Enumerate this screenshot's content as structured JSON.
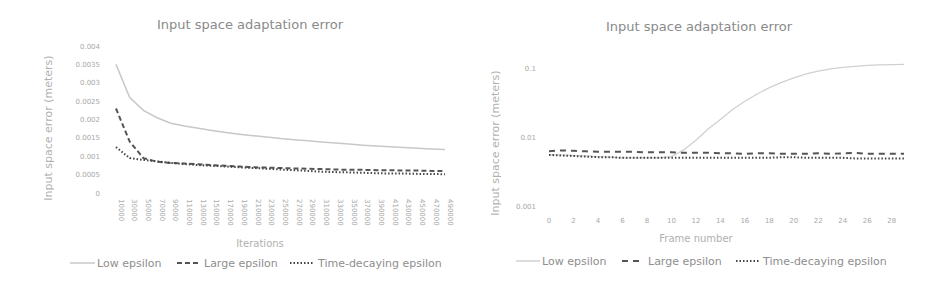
{
  "chart_data": [
    {
      "type": "line",
      "title": "Input space adaptation error",
      "xlabel": "Iterations",
      "ylabel": "Input space error (meters)",
      "y_scale": "linear",
      "ylim": [
        0,
        0.004
      ],
      "y_ticks": [
        "0",
        "0.0005",
        "0.001",
        "0.0015",
        "0.002",
        "0.0025",
        "0.003",
        "0.0035",
        "0.004"
      ],
      "x_ticks": [
        "10000",
        "30000",
        "50000",
        "70000",
        "90000",
        "110000",
        "130000",
        "150000",
        "170000",
        "190000",
        "210000",
        "230000",
        "250000",
        "270000",
        "290000",
        "310000",
        "330000",
        "350000",
        "370000",
        "390000",
        "410000",
        "430000",
        "450000",
        "470000",
        "490000"
      ],
      "legend_position": "bottom",
      "grid": false,
      "series": [
        {
          "name": "Low epsilon",
          "style": "solid",
          "color": "#c8c8c8",
          "values": [
            0.0035,
            0.0026,
            0.00225,
            0.00205,
            0.0019,
            0.00182,
            0.00176,
            0.0017,
            0.00165,
            0.0016,
            0.00156,
            0.00152,
            0.00148,
            0.00145,
            0.00142,
            0.00139,
            0.00136,
            0.00133,
            0.0013,
            0.00128,
            0.00126,
            0.00124,
            0.00122,
            0.0012,
            0.00118
          ]
        },
        {
          "name": "Large epsilon",
          "style": "dashed",
          "color": "#555555",
          "values": [
            0.0023,
            0.0014,
            0.00095,
            0.00085,
            0.00082,
            0.0008,
            0.00078,
            0.00076,
            0.00074,
            0.00072,
            0.0007,
            0.00069,
            0.00068,
            0.00067,
            0.00066,
            0.00065,
            0.00064,
            0.00063,
            0.00063,
            0.00062,
            0.00062,
            0.00061,
            0.00061,
            0.0006,
            0.0006
          ]
        },
        {
          "name": "Time-decaying epsilon",
          "style": "dotted",
          "color": "#444444",
          "values": [
            0.00125,
            0.00095,
            0.0009,
            0.00086,
            0.00082,
            0.00079,
            0.00076,
            0.00074,
            0.00072,
            0.0007,
            0.00068,
            0.00066,
            0.00064,
            0.00062,
            0.0006,
            0.00058,
            0.00057,
            0.00056,
            0.00055,
            0.00054,
            0.00053,
            0.00053,
            0.00052,
            0.00052,
            0.00051
          ]
        }
      ]
    },
    {
      "type": "line",
      "title": "Input space adaptation error",
      "xlabel": "Frame number",
      "ylabel": "Input space error (meters)",
      "y_scale": "log",
      "ylim": [
        0.001,
        0.1
      ],
      "y_ticks": [
        "0.001",
        "0.01",
        "0.1"
      ],
      "x_ticks": [
        "0",
        "2",
        "4",
        "6",
        "8",
        "10",
        "12",
        "14",
        "16",
        "18",
        "20",
        "22",
        "24",
        "26",
        "28"
      ],
      "legend_position": "bottom",
      "grid": false,
      "series": [
        {
          "name": "Low epsilon",
          "style": "solid",
          "color": "#d0d0d0",
          "x": [
            0,
            1,
            2,
            3,
            4,
            5,
            6,
            7,
            8,
            9,
            10,
            11,
            12,
            13,
            14,
            15,
            16,
            17,
            18,
            19,
            20,
            21,
            22,
            23,
            24,
            25,
            26,
            27,
            28,
            29
          ],
          "values": [
            0.0055,
            0.0055,
            0.0054,
            0.0053,
            0.0052,
            0.0051,
            0.005,
            0.005,
            0.005,
            0.005,
            0.0052,
            0.0065,
            0.009,
            0.013,
            0.018,
            0.025,
            0.033,
            0.042,
            0.052,
            0.062,
            0.072,
            0.082,
            0.09,
            0.097,
            0.102,
            0.106,
            0.109,
            0.111,
            0.112,
            0.113
          ]
        },
        {
          "name": "Large epsilon",
          "style": "dashed",
          "color": "#555555",
          "x": [
            0,
            1,
            2,
            3,
            4,
            5,
            6,
            7,
            8,
            9,
            10,
            11,
            12,
            13,
            14,
            15,
            16,
            17,
            18,
            19,
            20,
            21,
            22,
            23,
            24,
            25,
            26,
            27,
            28,
            29
          ],
          "values": [
            0.0062,
            0.0064,
            0.0063,
            0.0062,
            0.0061,
            0.0061,
            0.0061,
            0.0061,
            0.006,
            0.006,
            0.006,
            0.0059,
            0.0059,
            0.0059,
            0.0058,
            0.0058,
            0.0057,
            0.0058,
            0.0058,
            0.0057,
            0.0057,
            0.0057,
            0.0058,
            0.0057,
            0.0058,
            0.0059,
            0.0057,
            0.0057,
            0.0057,
            0.0057
          ]
        },
        {
          "name": "Time-decaying epsilon",
          "style": "dotted",
          "color": "#444444",
          "x": [
            0,
            1,
            2,
            3,
            4,
            5,
            6,
            7,
            8,
            9,
            10,
            11,
            12,
            13,
            14,
            15,
            16,
            17,
            18,
            19,
            20,
            21,
            22,
            23,
            24,
            25,
            26,
            27,
            28,
            29
          ],
          "values": [
            0.0055,
            0.0054,
            0.0053,
            0.0052,
            0.0051,
            0.0051,
            0.005,
            0.005,
            0.005,
            0.005,
            0.005,
            0.005,
            0.005,
            0.005,
            0.005,
            0.005,
            0.005,
            0.005,
            0.005,
            0.0051,
            0.0051,
            0.005,
            0.005,
            0.005,
            0.005,
            0.0049,
            0.0049,
            0.0049,
            0.0049,
            0.0049
          ]
        }
      ]
    }
  ]
}
